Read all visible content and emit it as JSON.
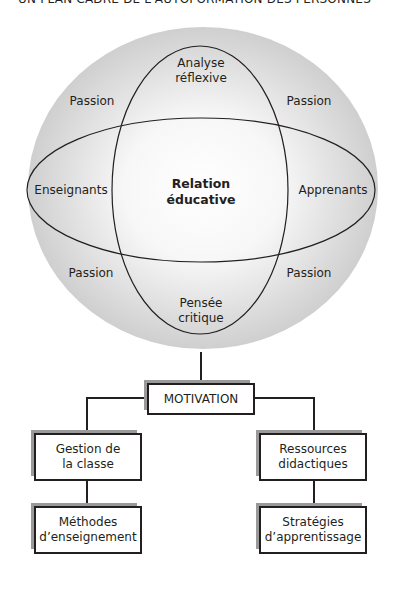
{
  "header": {
    "text": "UN PLAN CADRE DE L'AUTOFORMATION DES PERSONNES"
  },
  "diagram": {
    "center": [
      "Relation",
      "éducative"
    ],
    "top": [
      "Analyse",
      "réflexive"
    ],
    "bottom": [
      "Pensée",
      "critique"
    ],
    "left": "Enseignants",
    "right": "Apprenants",
    "corners": {
      "top_left": "Passion",
      "top_right": "Passion",
      "bottom_left": "Passion",
      "bottom_right": "Passion"
    }
  },
  "flow": {
    "root": "MOTIVATION",
    "left_branch": {
      "level1": [
        "Gestion de",
        "la classe"
      ],
      "level2": [
        "Méthodes",
        "d’enseignement"
      ]
    },
    "right_branch": {
      "level1": [
        "Ressources",
        "didactiques"
      ],
      "level2": [
        "Stratégies",
        "d’apprentissage"
      ]
    }
  },
  "colors": {
    "line": "#231f20",
    "sphere_edge": "#c9c9c9",
    "sphere_center": "#ffffff",
    "shadow": "#9a9a9a"
  }
}
